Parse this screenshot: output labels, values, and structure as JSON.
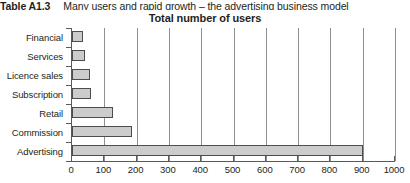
{
  "caption": {
    "label": "Table A1.3",
    "text": "Many users and rapid growth – the advertising business model"
  },
  "chart_data": {
    "type": "bar",
    "orientation": "horizontal",
    "title": "Total number of users",
    "xlabel": "",
    "ylabel": "",
    "categories": [
      "Financial",
      "Services",
      "Licence sales",
      "Subscription",
      "Retail",
      "Commission",
      "Advertising"
    ],
    "values": [
      34,
      40,
      56,
      59,
      127,
      185,
      900
    ],
    "xlim": [
      0,
      1000
    ],
    "xticks": [
      0,
      100,
      200,
      300,
      400,
      500,
      600,
      700,
      800,
      900,
      1000
    ],
    "xtick_labels": [
      "0",
      "100",
      "200",
      "300",
      "400",
      "500",
      "600",
      "700",
      "800",
      "900",
      "1000"
    ],
    "grid": "vertical",
    "legend": "none",
    "bar_fill_color": "#cccccc",
    "bar_edge_color": "#4d4d4f",
    "axis_color": "#58595b",
    "gridline_color": "#8d8f91"
  }
}
